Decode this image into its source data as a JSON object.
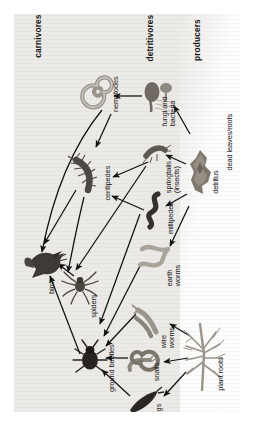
{
  "diagram": {
    "orientation": "rotated-90",
    "zones": [
      {
        "id": "carnivores",
        "label": "carnivores",
        "bold": true
      },
      {
        "id": "detritivores",
        "label": "detritivores",
        "bold": true
      },
      {
        "id": "producers",
        "label": "producers",
        "bold": true
      }
    ],
    "nodes": [
      {
        "id": "nematodes",
        "label": "nematodes",
        "icon": "nematode-coil-icon"
      },
      {
        "id": "fungi",
        "label": "fungi and\nbacteria",
        "icon": "mushroom-icon"
      },
      {
        "id": "centipedes",
        "label": "centipedes",
        "icon": "centipede-icon"
      },
      {
        "id": "springtails",
        "label": "springtails\n(insects)",
        "icon": "springtail-icon"
      },
      {
        "id": "millipedes",
        "label": "millipedes",
        "icon": "millipede-icon"
      },
      {
        "id": "detritus",
        "label": "detritus",
        "icon": "detritus-icon"
      },
      {
        "id": "deadleaves",
        "label": "dead leaves/roots",
        "icon": "text-only"
      },
      {
        "id": "birds",
        "label": "birds",
        "icon": "bird-icon"
      },
      {
        "id": "spiders",
        "label": "spiders",
        "icon": "spider-icon"
      },
      {
        "id": "earthworms",
        "label": "earth\nworms",
        "icon": "earthworm-icon"
      },
      {
        "id": "groundbeetles",
        "label": "ground beetles",
        "icon": "beetle-icon"
      },
      {
        "id": "wireworms",
        "label": "wire\nworms",
        "icon": "wireworm-icon"
      },
      {
        "id": "snails",
        "label": "snails",
        "icon": "snail-icon"
      },
      {
        "id": "slugs",
        "label": "slugs",
        "icon": "slug-icon"
      },
      {
        "id": "plantroots",
        "label": "plant roots",
        "icon": "roots-icon"
      }
    ],
    "edges": [
      {
        "from": "fungi",
        "to": "nematodes"
      },
      {
        "from": "nematodes",
        "to": "centipedes"
      },
      {
        "from": "springtails",
        "to": "centipedes"
      },
      {
        "from": "millipedes",
        "to": "centipedes"
      },
      {
        "from": "detritus",
        "to": "fungi"
      },
      {
        "from": "detritus",
        "to": "springtails"
      },
      {
        "from": "detritus",
        "to": "millipedes"
      },
      {
        "from": "detritus",
        "to": "earthworms"
      },
      {
        "from": "nematodes",
        "to": "birds"
      },
      {
        "from": "centipedes",
        "to": "birds"
      },
      {
        "from": "centipedes",
        "to": "spiders"
      },
      {
        "from": "spiders",
        "to": "birds"
      },
      {
        "from": "groundbeetles",
        "to": "birds"
      },
      {
        "from": "springtails",
        "to": "spiders"
      },
      {
        "from": "millipedes",
        "to": "groundbeetles"
      },
      {
        "from": "earthworms",
        "to": "groundbeetles"
      },
      {
        "from": "wireworms",
        "to": "groundbeetles"
      },
      {
        "from": "snails",
        "to": "groundbeetles"
      },
      {
        "from": "slugs",
        "to": "groundbeetles"
      },
      {
        "from": "plantroots",
        "to": "wireworms"
      },
      {
        "from": "plantroots",
        "to": "snails"
      },
      {
        "from": "plantroots",
        "to": "slugs"
      }
    ],
    "colors": {
      "background": "#ffffff",
      "panel": "#eceae7",
      "producer_zone": "#fdfdfd",
      "ink": "#151515",
      "arrow": "#111111",
      "dark_organism": "#3a3a38",
      "mid_organism": "#7b756d",
      "light_organism": "#a9a39a"
    }
  }
}
